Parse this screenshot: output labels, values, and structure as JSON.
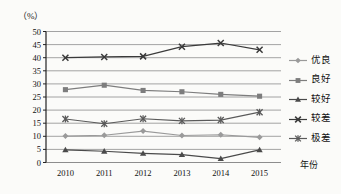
{
  "chart_data": {
    "type": "line",
    "title": "",
    "unit_label": "（%）",
    "xlabel": "年份",
    "ylabel": "",
    "categories": [
      "2010",
      "2011",
      "2012",
      "2013",
      "2014",
      "2015"
    ],
    "ylim": [
      0,
      50
    ],
    "yticks": [
      0,
      5,
      10,
      15,
      20,
      25,
      30,
      35,
      40,
      45,
      50
    ],
    "ytick_labels": [
      "0",
      "5",
      "10",
      "15",
      "20",
      "25",
      "30",
      "35",
      "40",
      "45",
      "50"
    ],
    "grid": true,
    "legend_position": "right",
    "series": [
      {
        "name": "优良",
        "marker": "diamond",
        "color": "#9a9a9a",
        "values": [
          10.1,
          10.4,
          12.0,
          10.3,
          10.6,
          9.6
        ]
      },
      {
        "name": "良好",
        "marker": "square",
        "color": "#7d7d7d",
        "values": [
          27.8,
          29.5,
          27.5,
          27.0,
          26.0,
          25.3
        ]
      },
      {
        "name": "较好",
        "marker": "triangle",
        "color": "#4a4a4a",
        "values": [
          4.8,
          4.3,
          3.5,
          3.0,
          1.5,
          4.8
        ]
      },
      {
        "name": "较差",
        "marker": "x",
        "color": "#3a3a3a",
        "values": [
          40.0,
          40.3,
          40.5,
          44.2,
          45.6,
          43.0
        ]
      },
      {
        "name": "极差",
        "marker": "asterisk",
        "color": "#5a5a5a",
        "values": [
          16.6,
          14.8,
          16.7,
          15.9,
          16.2,
          19.2
        ]
      }
    ]
  },
  "legend": {
    "items": [
      {
        "label": "优良",
        "marker": "diamond"
      },
      {
        "label": "良好",
        "marker": "square"
      },
      {
        "label": "较好",
        "marker": "triangle"
      },
      {
        "label": "较差",
        "marker": "x"
      },
      {
        "label": "极差",
        "marker": "asterisk"
      }
    ]
  },
  "axis": {
    "unit": "（%）",
    "x_title": "年份"
  }
}
